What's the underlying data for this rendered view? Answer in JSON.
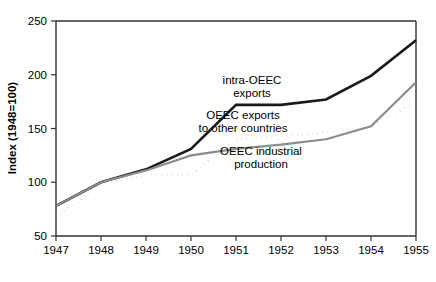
{
  "chart_data": {
    "type": "line",
    "title": "",
    "xlabel": "",
    "ylabel": "Index  (1948=100)",
    "x": [
      1947,
      1948,
      1949,
      1950,
      1951,
      1952,
      1953,
      1954,
      1955
    ],
    "xticks": [
      "1947",
      "1948",
      "1949",
      "1950",
      "1951",
      "1952",
      "1953",
      "1954",
      "1955"
    ],
    "yticks": [
      "50",
      "100",
      "150",
      "200",
      "250"
    ],
    "ytick_values": [
      50,
      100,
      150,
      200,
      250
    ],
    "ylim": [
      50,
      250
    ],
    "xlim": [
      1947,
      1955
    ],
    "grid": false,
    "legend_position": "inline-annotations",
    "series": [
      {
        "name": "intra-OEEC exports",
        "style": "solid",
        "color": "#1a1a1a",
        "width": 2.6,
        "values": [
          78,
          100,
          112,
          131,
          172,
          172,
          177,
          199,
          232
        ]
      },
      {
        "name": "OEEC exports to other countries",
        "style": "dotted",
        "color": "#1a1a1a",
        "width": 2.6,
        "values": [
          68,
          98,
          107,
          107,
          140,
          143,
          146,
          152,
          175
        ]
      },
      {
        "name": "OEEC industrial production",
        "style": "solid",
        "color": "#8c8c8c",
        "width": 2.2,
        "values": [
          78,
          100,
          111,
          125,
          131,
          135,
          140,
          152,
          193
        ]
      }
    ],
    "annotations": [
      {
        "name": "intra-oeec-exports",
        "lines": [
          "intra-OEEC",
          "exports"
        ],
        "x": 252,
        "y": 84
      },
      {
        "name": "oeec-exports-other-countries",
        "lines": [
          "OEEC exports",
          "to other countries"
        ],
        "x": 243,
        "y": 119
      },
      {
        "name": "oeec-industrial-production",
        "lines": [
          "OEEC industrial",
          "production"
        ],
        "x": 261,
        "y": 155
      }
    ]
  },
  "geometry": {
    "plot_left": 56,
    "plot_right": 416,
    "plot_top": 21,
    "plot_bottom": 236,
    "ylabel_x": 16,
    "ylabel_y": 128
  }
}
